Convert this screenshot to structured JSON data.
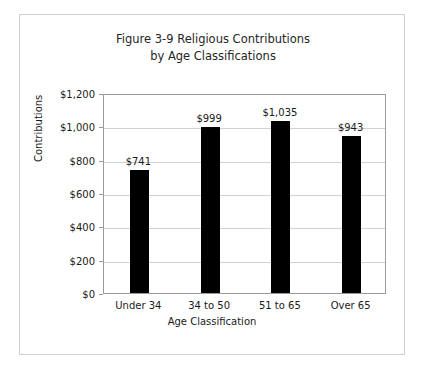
{
  "figure": {
    "title_line1": "Figure 3-9 Religious Contributions",
    "title_line2": "by Age Classifications"
  },
  "chart_data": {
    "type": "bar",
    "title": "Figure 3-9 Religious Contributions by Age Classifications",
    "xlabel": "Age Classification",
    "ylabel": "Contributions",
    "categories": [
      "Under 34",
      "34 to 50",
      "51 to 65",
      "Over 65"
    ],
    "values": [
      741,
      999,
      1035,
      943
    ],
    "data_labels": [
      "$741",
      "$999",
      "$1,035",
      "$943"
    ],
    "ylim": [
      0,
      1200
    ],
    "ytick_values": [
      0,
      200,
      400,
      600,
      800,
      1000,
      1200
    ],
    "ytick_labels": [
      "$0",
      "$200",
      "$400",
      "$600",
      "$800",
      "$1,000",
      "$1,200"
    ],
    "grid": true,
    "legend": false,
    "bar_color": "#000000",
    "gridline_color": "#d2d2d2",
    "plot_border_color": "#9a9a9a",
    "frame_border_color": "#cfcfcf",
    "background_color": "#ffffff"
  }
}
